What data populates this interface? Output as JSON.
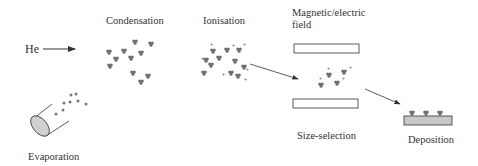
{
  "diagram": {
    "stages": [
      {
        "id": "evaporation",
        "label": "Evaporation"
      },
      {
        "id": "condensation",
        "label": "Condensation"
      },
      {
        "id": "ionisation",
        "label": "Ionisation"
      },
      {
        "id": "field",
        "label_line1": "Magnetic/electric",
        "label_line2": "field"
      },
      {
        "id": "size-selection",
        "label": "Size-selection"
      },
      {
        "id": "deposition",
        "label": "Deposition"
      }
    ],
    "gas_input": {
      "label": "He"
    },
    "ion_charge_symbol": "+",
    "colors": {
      "ink": "#333333",
      "cluster": "#6e6e6e",
      "substrate": "#c8c8c8",
      "source_fill": "#d0d0d0"
    }
  }
}
